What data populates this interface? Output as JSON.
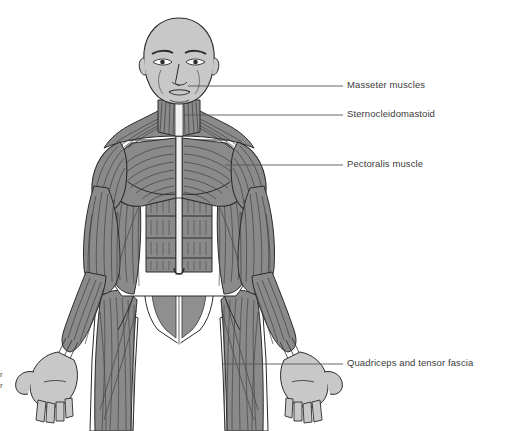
{
  "illustration": {
    "title": "Anterior view of human muscular system",
    "view": "anterior",
    "background_color": "#ffffff",
    "muscle_fill": "#8a8a8a",
    "skin_fill": "#c8c8c8",
    "tendon_fill": "#f2f2f2",
    "outline_color": "#2b2b2b",
    "fiber_color": "#3a3a3a",
    "leader_color": "#555555"
  },
  "labels": [
    {
      "id": "masseter",
      "text": "Masseter muscles",
      "text_x": 347,
      "text_y": 79,
      "leader": {
        "x1": 188,
        "y1": 86,
        "x2": 343,
        "y2": 86
      }
    },
    {
      "id": "sternocleidomastoid",
      "text": "Sternocleidomastoid",
      "text_x": 347,
      "text_y": 108,
      "leader": {
        "x1": 184,
        "y1": 115,
        "x2": 343,
        "y2": 115
      }
    },
    {
      "id": "pectoralis",
      "text": "Pectoralis muscle",
      "text_x": 347,
      "text_y": 158,
      "leader": {
        "x1": 225,
        "y1": 165,
        "x2": 343,
        "y2": 165
      }
    },
    {
      "id": "quadriceps",
      "text": "Quadriceps and tensor fascia",
      "text_x": 347,
      "text_y": 357,
      "leader": {
        "x1": 222,
        "y1": 364,
        "x2": 343,
        "y2": 364
      }
    }
  ],
  "edge_fragments": [
    {
      "id": "edge-fragment-upper",
      "text": "r",
      "x": 0,
      "y": 370
    },
    {
      "id": "edge-fragment-lower",
      "text": "r",
      "x": 0,
      "y": 381
    }
  ]
}
